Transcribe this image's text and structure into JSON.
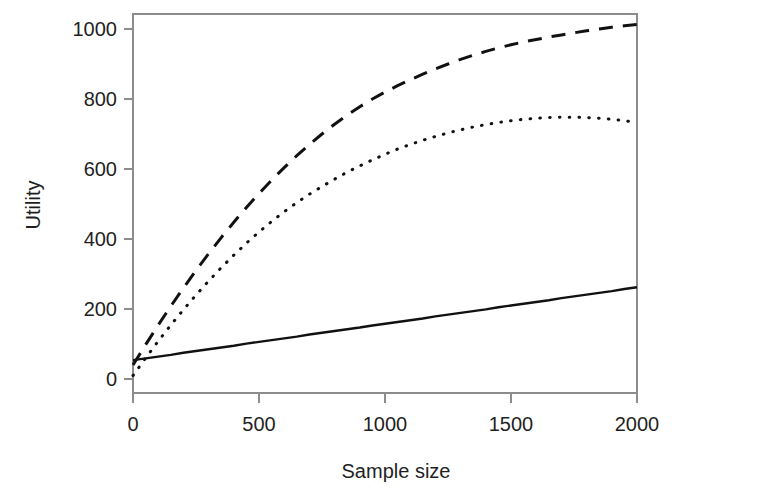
{
  "chart_data": {
    "type": "line",
    "title": "",
    "xlabel": "Sample size",
    "ylabel": "Utility",
    "xlim": [
      0,
      2000
    ],
    "ylim": [
      0,
      1060
    ],
    "grid": false,
    "legend": "none",
    "background": "#ffffff",
    "ink_color": "#111111",
    "axis_color": "#8c8c8c",
    "x_ticks": [
      0,
      500,
      1000,
      1500,
      2000
    ],
    "x_tick_labels": [
      "0",
      "500",
      "1000",
      "1500",
      "2000"
    ],
    "y_ticks": [
      0,
      200,
      400,
      600,
      800,
      1000
    ],
    "y_tick_labels": [
      "0",
      "200",
      "400",
      "600",
      "800",
      "1000"
    ],
    "x": [
      0,
      50,
      100,
      150,
      200,
      250,
      300,
      350,
      400,
      450,
      500,
      550,
      600,
      650,
      700,
      750,
      800,
      850,
      900,
      950,
      1000,
      1050,
      1100,
      1150,
      1200,
      1250,
      1300,
      1350,
      1400,
      1450,
      1500,
      1550,
      1600,
      1650,
      1700,
      1750,
      1800,
      1850,
      1900,
      1950,
      2000
    ],
    "series": [
      {
        "name": "dashed-curve",
        "style": "dashed",
        "values": [
          40,
          98,
          154,
          208,
          260,
          310,
          358,
          404,
          448,
          490,
          530,
          568,
          604,
          638,
          670,
          700,
          728,
          754,
          778,
          800,
          820,
          838,
          855,
          871,
          886,
          900,
          913,
          925,
          936,
          946,
          955,
          963,
          970,
          977,
          983,
          989,
          995,
          1000,
          1005,
          1009,
          1013
        ]
      },
      {
        "name": "dotted-curve",
        "style": "dotted",
        "values": [
          10,
          60,
          108,
          154,
          198,
          240,
          280,
          318,
          354,
          388,
          420,
          450,
          478,
          504,
          528,
          550,
          571,
          591,
          609,
          626,
          642,
          657,
          670,
          682,
          693,
          703,
          712,
          720,
          727,
          733,
          738,
          742,
          745,
          747,
          748,
          748,
          747,
          745,
          742,
          738,
          733
        ]
      },
      {
        "name": "solid-line",
        "style": "solid",
        "values": [
          54,
          59,
          64,
          69,
          75,
          80,
          85,
          90,
          95,
          101,
          106,
          111,
          116,
          121,
          127,
          132,
          137,
          142,
          147,
          153,
          158,
          163,
          168,
          173,
          179,
          184,
          189,
          194,
          199,
          205,
          210,
          215,
          220,
          225,
          231,
          236,
          241,
          246,
          251,
          257,
          262
        ]
      }
    ],
    "dotted_peak": {
      "x": 1400,
      "y": 790
    }
  },
  "plot_geometry": {
    "left_px": 133,
    "right_px": 637,
    "top_px": 14,
    "bottom_px": 393,
    "y_zero_px": 379,
    "y_thousand_px": 29
  }
}
